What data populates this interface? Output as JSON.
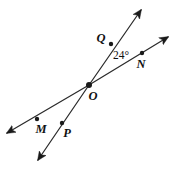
{
  "figure": {
    "type": "geometry-diagram",
    "canvas": {
      "width": 178,
      "height": 169,
      "background": "#ffffff"
    },
    "stroke_color": "#2b2b2b",
    "label_color": "#111111",
    "intersection": {
      "name": "O",
      "label": "O",
      "x": 89,
      "y": 85
    },
    "points": [
      {
        "name": "Q",
        "label": "Q",
        "dot_x": 111,
        "dot_y": 44,
        "label_x": 101,
        "label_y": 42
      },
      {
        "name": "N",
        "label": "N",
        "dot_x": 142,
        "dot_y": 53,
        "label_x": 141,
        "label_y": 68
      },
      {
        "name": "M",
        "label": "M",
        "dot_x": 37,
        "dot_y": 119,
        "label_x": 41,
        "label_y": 133
      },
      {
        "name": "P",
        "label": "P",
        "dot_x": 62,
        "dot_y": 123,
        "label_x": 67,
        "label_y": 137
      }
    ],
    "angle": {
      "label": "24°",
      "value": 24,
      "unit": "degrees",
      "vertex": "O",
      "between_rays": [
        "OQ",
        "ON"
      ],
      "label_x": 113,
      "label_y": 59
    },
    "lines": [
      {
        "name": "line-QP",
        "through_points": [
          "Q",
          "O",
          "P"
        ],
        "end_a": {
          "x": 141,
          "y": 10,
          "arrow": true
        },
        "end_b": {
          "x": 38,
          "y": 160,
          "arrow": true
        }
      },
      {
        "name": "line-MN",
        "through_points": [
          "M",
          "O",
          "N"
        ],
        "end_a": {
          "x": 168,
          "y": 37,
          "arrow": true
        },
        "end_b": {
          "x": 7,
          "y": 133,
          "arrow": true
        }
      }
    ],
    "arrowheads": [
      {
        "name": "arrowhead-upper-QP",
        "tip_x": 141,
        "tip_y": 10
      },
      {
        "name": "arrowhead-upper-MN",
        "tip_x": 168,
        "tip_y": 37
      },
      {
        "name": "arrowhead-lower-MN",
        "tip_x": 7,
        "tip_y": 133
      },
      {
        "name": "arrowhead-lower-QP",
        "tip_x": 38,
        "tip_y": 160
      }
    ]
  }
}
